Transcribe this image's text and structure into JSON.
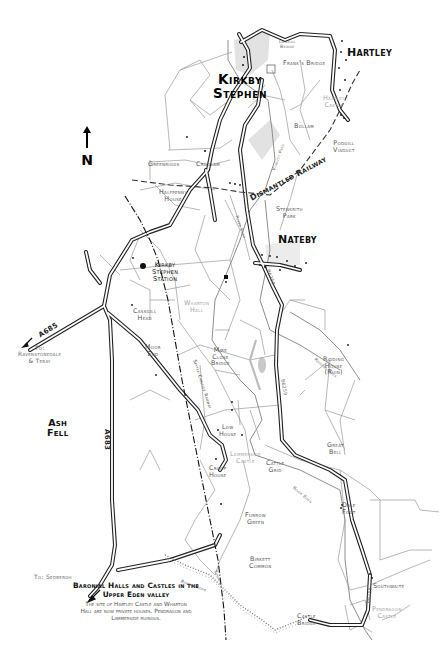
{
  "map": {
    "north_label": "N",
    "towns": {
      "kirkby_line1": "Kirkby",
      "kirkby_line2": "Stephen",
      "hartley": "Hartley",
      "nateby": "Nateby"
    },
    "fell": {
      "line1": "Ash",
      "line2": "Fell"
    },
    "places": {
      "lowgill_bridge_1": "Lowgill",
      "lowgill_bridge_2": "Bridge",
      "franks_bridge": "Frank's Bridge",
      "bollam": "Bollam",
      "podgill_1": "Podgill",
      "podgill_2": "Viaduct",
      "greenriggs": "Greenriggs",
      "croglam": "Croglam",
      "halfpenny_1": "Halfpenny",
      "halfpenny_2": "House",
      "stenkrith_1": "Stenkrith",
      "stenkrith_2": "Park",
      "station_1": "Kirkby",
      "station_2": "Stephen",
      "station_3": "Station",
      "cassgill_1": "Cassgill",
      "cassgill_2": "Head",
      "moor_end_1": "Moor",
      "moor_end_2": "End",
      "mire_close_1": "Mire",
      "mire_close_2": "Close",
      "mire_close_3": "Bridge",
      "ridding_1": "Ridding",
      "ridding_2": "House",
      "ridding_3": "(Ruin)",
      "low_house_1": "Low",
      "low_house_2": "House",
      "croop_1": "Croop",
      "croop_2": "House",
      "cattle_grid_1": "Cattle",
      "cattle_grid_2": "Grid",
      "great_bell_1": "Great",
      "great_bell_2": "Bell",
      "dale_foot_1": "Dale",
      "dale_foot_2": "Foot",
      "furrow_1": "Furrow",
      "furrow_2": "Green",
      "birkett_1": "Birkett",
      "birkett_2": "Common",
      "southwaite": "Southwaite",
      "castle_bridge_1": "Castle",
      "castle_bridge_2": "Bridge"
    },
    "heritage_sites": {
      "hartley_castle_1": "Hartley",
      "hartley_castle_2": "Castle",
      "wharton_1": "Wharton",
      "wharton_2": "Hall",
      "lammerside_1": "Lammerside",
      "lammerside_2": "Castle",
      "pendragon_1": "Pendragon",
      "pendragon_2": "Castle"
    },
    "features": {
      "dismantled_railway": "Dismantled Railway",
      "settle_carlisle": "Settle-Carlisle Railway",
      "river_eden_upper": "River Eden",
      "river_eden_lower": "River Eden",
      "podgill_path": "Viaduct Path",
      "tarn_beck": "Tarn Beck",
      "rabbit_beck": "Ridding Beck",
      "roman_road": "Roman Road",
      "tunnel": "Tunnel"
    },
    "roads": {
      "a685": "A685",
      "a683": "A683",
      "b6259_north": "B6259",
      "b6259_mid": "B6259",
      "b6259_south": "B6259"
    },
    "destinations": {
      "ravenstonedale_1": "To:",
      "ravenstonedale_2": "Ravenstonedale",
      "ravenstonedale_3": "& Tebay",
      "sedbergh": "To: Sedbergh"
    },
    "caption": {
      "title_line1": "Baronial Halls and Castles in the",
      "title_line2": "Upper Eden valley",
      "body_line1": "The site of Hartley Castle and Wharton",
      "body_line2": "Hall are now private houses. Pendragon and",
      "body_line3": "Lammerside ruinous."
    }
  }
}
